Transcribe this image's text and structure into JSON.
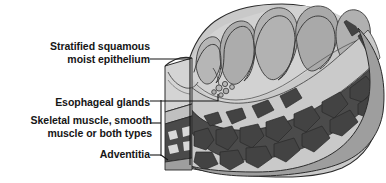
{
  "figure": {
    "background_color": "#ffffff",
    "labels": [
      {
        "id": "epithelium",
        "name": "stratified-squamous-moist-epithelium",
        "line1": "Stratified squamous",
        "line2": "moist epithelium",
        "leader": "horizontal-then-vertical"
      },
      {
        "id": "glands",
        "name": "esophageal-glands",
        "line1": "Esophageal glands",
        "line2": "",
        "leader": "horizontal"
      },
      {
        "id": "muscle",
        "name": "skeletal-muscle-smooth-muscle-or-both-types",
        "line1": "Skeletal muscle, smooth",
        "line2": "muscle or both types",
        "leader": "bracket"
      },
      {
        "id": "adventitia",
        "name": "adventitia",
        "line1": "Adventitia",
        "line2": "",
        "leader": "horizontal"
      }
    ],
    "colors": {
      "text": "#161616",
      "leader_line": "#1a1a1a",
      "outline": "#2b2b2b",
      "mucosa_light": "#d8d8d8",
      "mucosa_mid": "#b4b4b4",
      "lumen_fold": "#a8a8a8",
      "submucosa": "#c8c8c8",
      "muscle_dark": "#4a4a4a",
      "muscle_darker": "#3c3c3c",
      "adventitia_gray": "#9a9a9a",
      "cut_face_light": "#cfcfcf",
      "white": "#ffffff"
    },
    "structures": {
      "mucosal_folds": "rugae",
      "muscle_bundle_count": 22,
      "gland_cluster_count": 6
    }
  }
}
